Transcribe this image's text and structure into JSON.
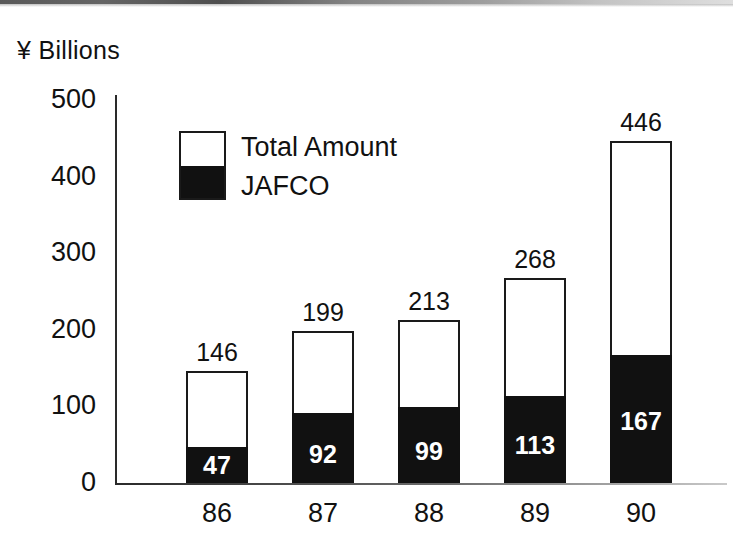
{
  "chart_data": {
    "type": "bar",
    "subtype": "stacked-bar",
    "title": "",
    "ylabel": "¥ Billions",
    "xlabel": "",
    "ylim": [
      0,
      500
    ],
    "yticks": [
      0,
      100,
      200,
      300,
      400,
      500
    ],
    "grid": false,
    "legend_position": "inside-upper-left",
    "categories": [
      "86",
      "87",
      "88",
      "89",
      "90"
    ],
    "series": [
      {
        "name": "Total Amount",
        "color": "#ffffff",
        "values": [
          146,
          199,
          213,
          268,
          446
        ]
      },
      {
        "name": "JAFCO",
        "color": "#111111",
        "values": [
          47,
          92,
          99,
          113,
          167
        ]
      }
    ],
    "total_labels": [
      "146",
      "199",
      "213",
      "268",
      "446"
    ],
    "jafco_labels": [
      "47",
      "92",
      "99",
      "113",
      "167"
    ],
    "ytick_labels": [
      "500",
      "400",
      "300",
      "200",
      "100",
      "0"
    ],
    "xtick_labels": [
      "86",
      "87",
      "88",
      "89",
      "90"
    ]
  },
  "axis": {
    "title": "¥ Billions"
  },
  "legend": {
    "entries": [
      {
        "label": "Total  Amount",
        "swatch": "white-swatch"
      },
      {
        "label": "JAFCO",
        "swatch": "black-swatch"
      }
    ]
  },
  "colors": {
    "ink": "#111111",
    "total_fill": "#ffffff",
    "jafco_fill": "#111111",
    "background": "#ffffff"
  }
}
